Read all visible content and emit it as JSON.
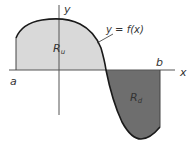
{
  "diagram": {
    "title": "",
    "curve_label": "y = f(x)",
    "axes": {
      "x_label": "x",
      "y_label": "y"
    },
    "bounds": {
      "left_label": "a",
      "right_label": "b"
    },
    "regions": [
      {
        "name": "upper-region",
        "label_main": "R",
        "label_sub": "u",
        "fill": "#d9d9d9",
        "position": "above x-axis"
      },
      {
        "name": "lower-region",
        "label_main": "R",
        "label_sub": "d",
        "fill": "#6e6e6e",
        "position": "below x-axis"
      }
    ],
    "colors": {
      "curve": "#1a1a1a",
      "axis": "#555555",
      "label": "#333333",
      "upper_fill": "#d9d9d9",
      "lower_fill": "#6e6e6e"
    }
  }
}
